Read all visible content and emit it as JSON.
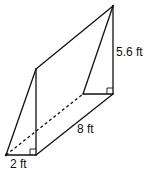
{
  "figure": {
    "type": "triangular-prism",
    "labels": {
      "height": "5.6 ft",
      "length": "8 ft",
      "base": "2 ft"
    },
    "colors": {
      "stroke": "#111111",
      "background": "#ffffff"
    }
  }
}
